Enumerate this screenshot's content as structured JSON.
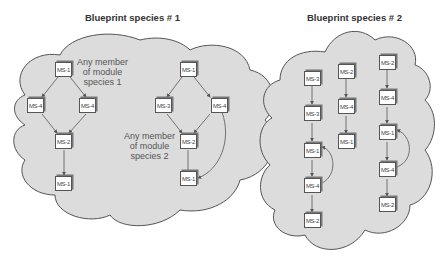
{
  "blueprints": [
    {
      "title": "Blueprint species # 1",
      "annotations": [
        {
          "line1": "Any member",
          "line2": "of module",
          "line3": "species 1"
        },
        {
          "line1": "Any member",
          "line2": "of module",
          "line3": "species 2"
        }
      ],
      "module_groups": [
        {
          "name": "module species 1",
          "nodes": [
            "MS-1",
            "MS-4",
            "MS-4",
            "MS-2",
            "MS-1"
          ],
          "edges": [
            [
              "MS-1",
              "MS-4 (left)"
            ],
            [
              "MS-1",
              "MS-4 (right)"
            ],
            [
              "MS-4 (left)",
              "MS-2"
            ],
            [
              "MS-4 (right)",
              "MS-2"
            ],
            [
              "MS-2",
              "MS-1"
            ]
          ]
        },
        {
          "name": "module species 2",
          "nodes": [
            "MS-1",
            "MS-3",
            "MS-4",
            "MS-2",
            "MS-1"
          ],
          "edges": [
            [
              "MS-1",
              "MS-3"
            ],
            [
              "MS-1",
              "MS-4"
            ],
            [
              "MS-3",
              "MS-2"
            ],
            [
              "MS-4",
              "MS-2"
            ],
            [
              "MS-2",
              "MS-1"
            ],
            [
              "MS-4",
              "MS-1 (curved)"
            ]
          ]
        }
      ]
    },
    {
      "title": "Blueprint species # 2",
      "chains": [
        {
          "nodes": [
            "MS-3",
            "MS-3",
            "MS-1",
            "MS-4",
            "MS-2"
          ],
          "loop": "MS-4 -> MS-1"
        },
        {
          "nodes": [
            "MS-2",
            "MS-4",
            "MS-1"
          ]
        },
        {
          "nodes": [
            "MS-2",
            "MS-4",
            "MS-1",
            "MS-4",
            "MS-2"
          ],
          "loop": "MS-4 -> MS-1"
        }
      ]
    }
  ],
  "colors": {
    "cloud_fill": "#dcdcdc",
    "cloud_stroke": "#555555",
    "box_fill": "#ffffff",
    "arrow": "#555555",
    "title_text": "#333333",
    "note_text": "#555555"
  }
}
